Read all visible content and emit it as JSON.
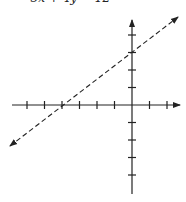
{
  "equation": {
    "text": "•   −3x + 4y = 12",
    "note": "text clipped at top edge"
  },
  "graph": {
    "type": "line-on-coordinate-plane",
    "origin_px": [
      132,
      105
    ],
    "unit_px": 17.5,
    "x_axis": {
      "min_units": -7,
      "max_units": 3,
      "ticks": [
        -6,
        -5,
        -4,
        -3,
        -2,
        -1,
        1,
        2
      ]
    },
    "y_axis": {
      "min_units": -5,
      "max_units": 5,
      "ticks": [
        4,
        3,
        2,
        1,
        -1,
        -2,
        -3,
        -4
      ]
    },
    "line": {
      "style": "dashed",
      "x_intercept": -4,
      "y_intercept": 3,
      "slope": 0.75,
      "arrows": "both"
    },
    "colors": {
      "axis": "#222222",
      "line": "#222222"
    }
  }
}
